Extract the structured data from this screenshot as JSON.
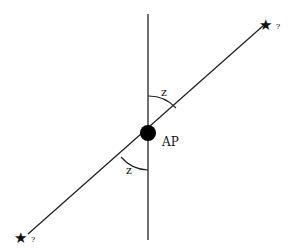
{
  "diagram": {
    "center_label": "AP",
    "angle_top_label": "z",
    "angle_bottom_label": "z",
    "star_top_mark": "?",
    "star_bottom_mark": "?",
    "colors": {
      "line": "#222222",
      "point": "#000000",
      "background": "#ffffff"
    }
  }
}
